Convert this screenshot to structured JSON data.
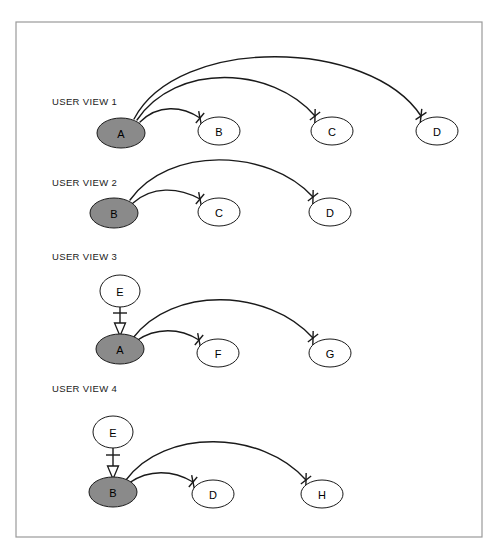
{
  "figure": {
    "title": "",
    "frame": {
      "x": 16,
      "y": 22,
      "width": 466,
      "height": 515,
      "border_color": "#9a9a9a"
    }
  },
  "style": {
    "node_fill_default": "#ffffff",
    "node_fill_highlight": "#8a8a8a",
    "node_stroke": "#1a1a1a",
    "edge_stroke": "#1a1a1a",
    "background": "#ffffff"
  },
  "views": [
    {
      "id": "user-view-1",
      "label": "USER VIEW 1",
      "label_x": 52,
      "label_y": 105,
      "nodes": [
        {
          "id": "v1-a",
          "label": "A",
          "cx": 121,
          "cy": 133,
          "rx": 24,
          "ry": 15,
          "fill": "#8a8a8a",
          "highlight": true
        },
        {
          "id": "v1-b",
          "label": "B",
          "cx": 219,
          "cy": 131,
          "rx": 21,
          "ry": 14,
          "fill": "#ffffff",
          "highlight": false
        },
        {
          "id": "v1-c",
          "label": "C",
          "cx": 332,
          "cy": 131,
          "rx": 21,
          "ry": 14,
          "fill": "#ffffff",
          "highlight": false
        },
        {
          "id": "v1-d",
          "label": "D",
          "cx": 437,
          "cy": 131,
          "rx": 21,
          "ry": 14,
          "fill": "#ffffff",
          "highlight": false
        }
      ],
      "edges": [
        {
          "id": "v1-a-b",
          "from": "A",
          "to": "B",
          "kind": "arc",
          "terminator": "cross-tick",
          "path": "M 140 122 C 158 104 182 106 200 118",
          "tick_x": 200,
          "tick_y": 118,
          "tick_angle": 40
        },
        {
          "id": "v1-a-c",
          "from": "A",
          "to": "C",
          "kind": "arc",
          "terminator": "cross-tick",
          "path": "M 137 120 C 176 62 272 66 315 116",
          "tick_x": 315,
          "tick_y": 116,
          "tick_angle": 52
        },
        {
          "id": "v1-a-d",
          "from": "A",
          "to": "D",
          "kind": "arc",
          "terminator": "cross-tick",
          "path": "M 134 119 C 178 35 370 38 421 116",
          "tick_x": 421,
          "tick_y": 116,
          "tick_angle": 57
        }
      ]
    },
    {
      "id": "user-view-2",
      "label": "USER VIEW 2",
      "label_x": 52,
      "label_y": 186,
      "nodes": [
        {
          "id": "v2-b",
          "label": "B",
          "cx": 114,
          "cy": 213,
          "rx": 24,
          "ry": 15,
          "fill": "#8a8a8a",
          "highlight": true
        },
        {
          "id": "v2-c",
          "label": "C",
          "cx": 219,
          "cy": 212,
          "rx": 21,
          "ry": 14,
          "fill": "#ffffff",
          "highlight": false
        },
        {
          "id": "v2-d",
          "label": "D",
          "cx": 330,
          "cy": 212,
          "rx": 21,
          "ry": 14,
          "fill": "#ffffff",
          "highlight": false
        }
      ],
      "edges": [
        {
          "id": "v2-b-c",
          "from": "B",
          "to": "C",
          "kind": "arc",
          "terminator": "cross-tick",
          "path": "M 133 203 C 152 186 178 187 200 199",
          "tick_x": 200,
          "tick_y": 199,
          "tick_angle": 40
        },
        {
          "id": "v2-b-d",
          "from": "B",
          "to": "D",
          "kind": "arc",
          "terminator": "cross-tick",
          "path": "M 130 200 C 168 146 268 148 313 197",
          "tick_x": 313,
          "tick_y": 197,
          "tick_angle": 52
        }
      ]
    },
    {
      "id": "user-view-3",
      "label": "USER VIEW 3",
      "label_x": 52,
      "label_y": 260,
      "nodes": [
        {
          "id": "v3-e",
          "label": "E",
          "cx": 120,
          "cy": 291,
          "rx": 20,
          "ry": 16,
          "fill": "#ffffff",
          "highlight": false
        },
        {
          "id": "v3-a",
          "label": "A",
          "cx": 120,
          "cy": 349,
          "rx": 24,
          "ry": 15,
          "fill": "#8a8a8a",
          "highlight": true
        },
        {
          "id": "v3-f",
          "label": "F",
          "cx": 218,
          "cy": 353,
          "rx": 21,
          "ry": 14,
          "fill": "#ffffff",
          "highlight": false
        },
        {
          "id": "v3-g",
          "label": "G",
          "cx": 330,
          "cy": 353,
          "rx": 21,
          "ry": 14,
          "fill": "#ffffff",
          "highlight": false
        }
      ],
      "edges": [
        {
          "id": "v3-e-a",
          "from": "E",
          "to": "A",
          "kind": "vertical",
          "terminator": "cross-tick-and-arrowhead",
          "x": 120,
          "y1": 307,
          "y2": 334,
          "tick_y": 313,
          "tick_half_width": 7
        },
        {
          "id": "v3-a-f",
          "from": "A",
          "to": "F",
          "kind": "arc",
          "terminator": "cross-tick",
          "path": "M 136 341 C 156 327 180 328 199 340",
          "tick_x": 199,
          "tick_y": 340,
          "tick_angle": 40
        },
        {
          "id": "v3-a-g",
          "from": "A",
          "to": "G",
          "kind": "arc",
          "terminator": "cross-tick",
          "path": "M 133 338 C 172 286 268 288 313 338",
          "tick_x": 313,
          "tick_y": 338,
          "tick_angle": 52
        }
      ]
    },
    {
      "id": "user-view-4",
      "label": "USER VIEW 4",
      "label_x": 52,
      "label_y": 392,
      "nodes": [
        {
          "id": "v4-e",
          "label": "E",
          "cx": 113,
          "cy": 432,
          "rx": 20,
          "ry": 16,
          "fill": "#ffffff",
          "highlight": false
        },
        {
          "id": "v4-b",
          "label": "B",
          "cx": 113,
          "cy": 492,
          "rx": 24,
          "ry": 15,
          "fill": "#8a8a8a",
          "highlight": true
        },
        {
          "id": "v4-d",
          "label": "D",
          "cx": 213,
          "cy": 494,
          "rx": 21,
          "ry": 14,
          "fill": "#ffffff",
          "highlight": false
        },
        {
          "id": "v4-h",
          "label": "H",
          "cx": 322,
          "cy": 494,
          "rx": 21,
          "ry": 14,
          "fill": "#ffffff",
          "highlight": false
        }
      ],
      "edges": [
        {
          "id": "v4-e-b",
          "from": "E",
          "to": "B",
          "kind": "vertical",
          "terminator": "cross-tick-and-arrowhead",
          "x": 113,
          "y1": 448,
          "y2": 477,
          "tick_y": 455,
          "tick_half_width": 7
        },
        {
          "id": "v4-b-d",
          "from": "B",
          "to": "D",
          "kind": "arc",
          "terminator": "cross-tick",
          "path": "M 129 483 C 149 469 173 470 193 482",
          "tick_x": 193,
          "tick_y": 482,
          "tick_angle": 40
        },
        {
          "id": "v4-b-h",
          "from": "B",
          "to": "H",
          "kind": "arc",
          "terminator": "cross-tick",
          "path": "M 126 480 C 164 428 262 430 306 480",
          "tick_x": 306,
          "tick_y": 480,
          "tick_angle": 52
        }
      ]
    }
  ]
}
